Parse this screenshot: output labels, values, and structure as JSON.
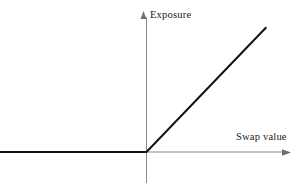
{
  "chart_data": {
    "type": "line",
    "title": "",
    "subtitle": "",
    "xlabel": "Swap value",
    "ylabel": "Exposure",
    "grid": false,
    "legend": null,
    "xlim": [
      -1.43,
      1.47
    ],
    "ylim": [
      -0.32,
      1.39
    ],
    "annotations": [],
    "series": [
      {
        "name": "Exposure profile",
        "description": "Exposure is zero for negative swap value and rises linearly one-for-one with positive swap value",
        "color": "#111111",
        "x": [
          -1.43,
          0,
          1.17
        ],
        "y": [
          0,
          0,
          1.14
        ],
        "kink_point": {
          "x": 0,
          "y": 0
        }
      }
    ],
    "axes": {
      "x": {
        "label": "Swap value",
        "arrow": true,
        "color": "#8a8a8a",
        "tick_labels": []
      },
      "y": {
        "label": "Exposure",
        "arrow": true,
        "color": "#8a8a8a",
        "tick_labels": []
      }
    }
  },
  "labels": {
    "y_axis": "Exposure",
    "x_axis": "Swap value"
  },
  "colors": {
    "background": "#ffffff",
    "axis": "#8a8a8a",
    "curve": "#111111",
    "text": "#1a1a1a"
  },
  "icons": {
    "y_arrow": "arrow-up-icon",
    "x_arrow": "arrow-right-icon"
  }
}
